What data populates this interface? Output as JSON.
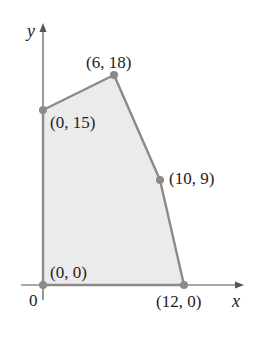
{
  "diagram": {
    "type": "feasible-region",
    "axes": {
      "x_label": "x",
      "y_label": "y",
      "origin_label": "0"
    },
    "vertices": [
      {
        "label": "(0, 0)",
        "x": 0,
        "y": 0
      },
      {
        "label": "(0, 15)",
        "x": 0,
        "y": 15
      },
      {
        "label": "(6, 18)",
        "x": 6,
        "y": 18
      },
      {
        "label": "(10, 9)",
        "x": 10,
        "y": 9
      },
      {
        "label": "(12, 0)",
        "x": 12,
        "y": 0
      }
    ],
    "colors": {
      "region_fill": "#ebebeb",
      "edge": "#8a8a8a",
      "axis": "#555555",
      "vertex": "#8a8a8a"
    }
  }
}
